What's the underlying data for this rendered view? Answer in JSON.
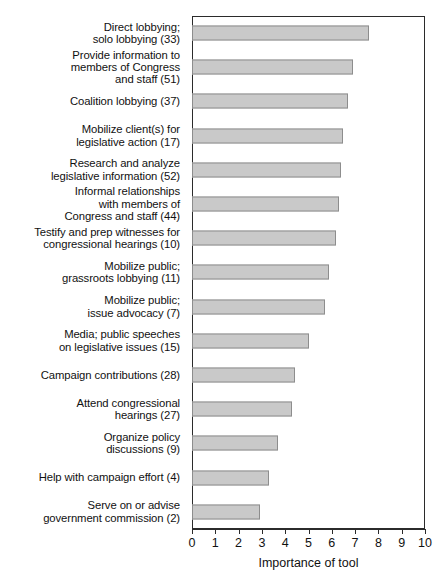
{
  "chart_data": {
    "type": "bar",
    "orientation": "horizontal",
    "title": "",
    "xlabel": "Importance of tool",
    "ylabel": "",
    "xlim": [
      0,
      10
    ],
    "xticks": [
      "0",
      "1",
      "2",
      "3",
      "4",
      "5",
      "6",
      "7",
      "8",
      "9",
      "10"
    ],
    "grid": false,
    "legend": null,
    "bar_color": "#c9c9c9",
    "bar_border_color": "#8d8d8d",
    "axis_color": "#2b2b2b",
    "categories": [
      "Direct lobbying;\nsolo lobbying (33)",
      "Provide information to\nmembers of Congress\nand staff (51)",
      "Coalition lobbying (37)",
      "Mobilize client(s) for\nlegislative action (17)",
      "Research and analyze\nlegislative information (52)",
      "Informal relationships\nwith members of\nCongress and staff (44)",
      "Testify and prep witnesses for\ncongressional hearings (10)",
      "Mobilize public;\ngrassroots lobbying (11)",
      "Mobilize public;\nissue advocacy (7)",
      "Media; public speeches\non legislative issues (15)",
      "Campaign contributions (28)",
      "Attend congressional\nhearings (27)",
      "Organize policy\ndiscussions (9)",
      "Help with campaign effort (4)",
      "Serve on or advise\ngovernment commission (2)"
    ],
    "values": [
      7.6,
      6.9,
      6.7,
      6.5,
      6.4,
      6.3,
      6.2,
      5.9,
      5.7,
      5.0,
      4.4,
      4.3,
      3.7,
      3.3,
      2.9
    ]
  }
}
